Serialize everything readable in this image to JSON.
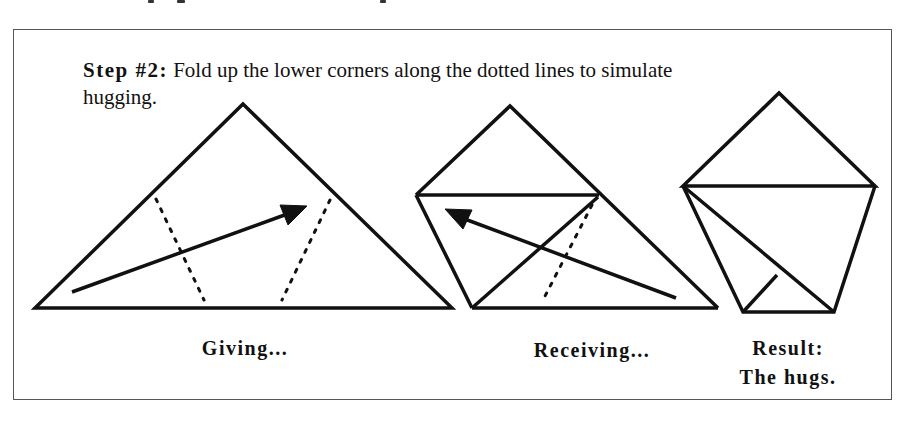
{
  "instruction": {
    "step_label": "Step #2:",
    "text": "Fold up the lower corners along the dotted lines to simulate",
    "text_line2": "hugging."
  },
  "figures": [
    {
      "id": "giving",
      "caption": "Giving..."
    },
    {
      "id": "receiving",
      "caption": "Receiving..."
    },
    {
      "id": "result",
      "caption_line1": "Result:",
      "caption_line2": "The hugs."
    }
  ],
  "colors": {
    "ink": "#111111",
    "frame": "#555555",
    "background": "#ffffff"
  }
}
